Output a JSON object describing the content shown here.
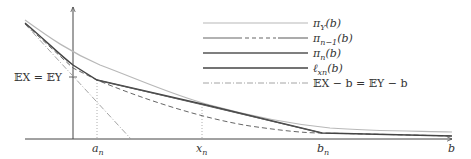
{
  "diagram": {
    "type": "function-plot",
    "axes": {
      "x_label": "b",
      "y_tick_label": "𝔼X = 𝔼Y",
      "x_ticks": [
        {
          "label_main": "a",
          "label_sub": "n",
          "x": 97
        },
        {
          "label_main": "x",
          "label_sub": "n",
          "x": 202
        },
        {
          "label_main": "b",
          "label_sub": "n",
          "x": 322
        }
      ]
    },
    "legend": [
      {
        "id": "piY",
        "main": "π",
        "sub": "Y",
        "tail": "(b)",
        "style": "solid-light"
      },
      {
        "id": "pin1",
        "main": "π",
        "sub": "n−1",
        "tail": "(b)",
        "style": "solid-dashed-solid"
      },
      {
        "id": "pin",
        "main": "π",
        "sub": "n",
        "tail": "(b)",
        "style": "solid-dark"
      },
      {
        "id": "lxn",
        "main": "ℓ",
        "sub": "xn",
        "tail": "(b)",
        "style": "solid-dark"
      },
      {
        "id": "exb",
        "main": "𝔼X − b = 𝔼Y − b",
        "sub": "",
        "tail": "",
        "style": "dash-dot"
      }
    ],
    "colors": {
      "axis": "#444444",
      "piY": "#b8b8b8",
      "pin": "#555555",
      "pin1": "#666666",
      "lxn": "#444444",
      "exb": "#9a9a9a",
      "guide": "#999999"
    }
  }
}
